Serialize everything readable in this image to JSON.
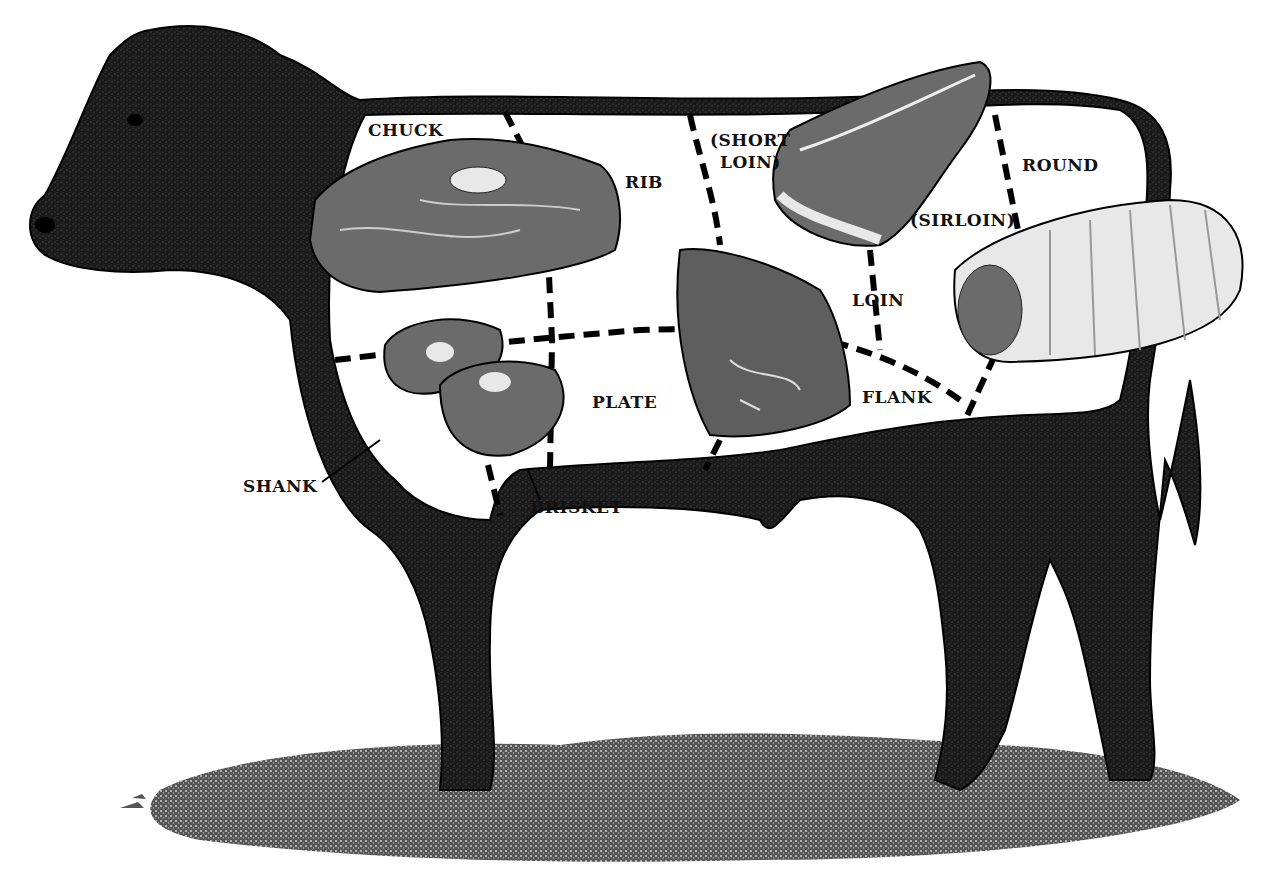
{
  "diagram": {
    "type": "beef-cuts-chart",
    "colors": {
      "ink": "#111111",
      "background": "#ffffff",
      "meat": "#6b6b6b",
      "fat": "#e8e8e8"
    },
    "labels": {
      "chuck": "CHUCK",
      "rib": "RIB",
      "short_loin_1": "(SHORT",
      "short_loin_2": "LOIN)",
      "round": "ROUND",
      "sirloin": "(SIRLOIN)",
      "loin": "LOIN",
      "plate": "PLATE",
      "flank": "FLANK",
      "shank": "SHANK",
      "brisket": "BRISKET"
    }
  }
}
